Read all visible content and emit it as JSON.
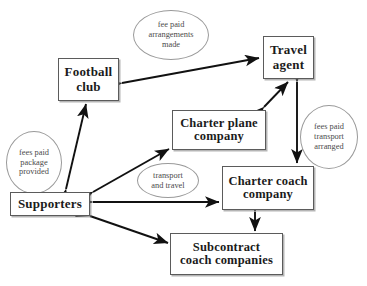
{
  "diagram": {
    "background": "#ffffff",
    "box_border_color": "#5b5b5b",
    "ellipse_border_color": "#9a9a9a",
    "arrow_color": "#111111",
    "nodes": [
      {
        "id": "football_club",
        "label": "Football\nclub",
        "line1": "Football",
        "line2": "club"
      },
      {
        "id": "travel_agent",
        "label": "Travel\nagent",
        "line1": "Travel",
        "line2": "agent"
      },
      {
        "id": "charter_plane",
        "label": "Charter plane\ncompany",
        "line1": "Charter plane",
        "line2": "company"
      },
      {
        "id": "charter_coach",
        "label": "Charter coach\ncompany",
        "line1": "Charter coach",
        "line2": "company"
      },
      {
        "id": "supporters",
        "label": "Supporters",
        "line1": "Supporters",
        "line2": ""
      },
      {
        "id": "subcontract_coaches",
        "label": "Subcontract\ncoach companies",
        "line1": "Subcontract",
        "line2": "coach companies"
      }
    ],
    "annotations": [
      {
        "id": "fee_paid_arrangements_made",
        "lines": [
          "fee paid",
          "arrangements",
          "made"
        ]
      },
      {
        "id": "fees_paid_package_provided",
        "lines": [
          "fees paid",
          "package",
          "provided"
        ]
      },
      {
        "id": "fees_paid_transport_arranged",
        "lines": [
          "fees paid",
          "transport",
          "arranged"
        ]
      },
      {
        "id": "transport_and_travel",
        "lines": [
          "transport",
          "and travel"
        ]
      }
    ],
    "edges": [
      {
        "id": "football_club--travel_agent",
        "from": "football_club",
        "to": "travel_agent",
        "heads": "both",
        "label": "fee paid arrangements made"
      },
      {
        "id": "charter_plane--travel_agent",
        "from": "charter_plane",
        "to": "travel_agent",
        "heads": "both",
        "label": ""
      },
      {
        "id": "travel_agent--charter_coach",
        "from": "travel_agent",
        "to": "charter_coach",
        "heads": "both",
        "label": "fees paid transport arranged"
      },
      {
        "id": "supporters--football_club",
        "from": "supporters",
        "to": "football_club",
        "heads": "both",
        "label": "fees paid package provided"
      },
      {
        "id": "supporters--charter_plane",
        "from": "supporters",
        "to": "charter_plane",
        "heads": "both",
        "label": ""
      },
      {
        "id": "supporters--charter_coach",
        "from": "supporters",
        "to": "charter_coach",
        "heads": "both",
        "label": "transport and travel"
      },
      {
        "id": "supporters--subcontract_coaches",
        "from": "supporters",
        "to": "subcontract_coaches",
        "heads": "both",
        "label": ""
      },
      {
        "id": "charter_coach--subcontract_coaches",
        "from": "charter_coach",
        "to": "subcontract_coaches",
        "heads": "both",
        "label": ""
      }
    ]
  }
}
